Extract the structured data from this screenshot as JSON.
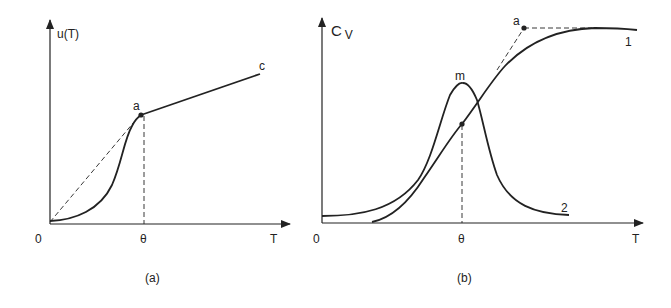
{
  "panel_a": {
    "caption": "(a)",
    "y_label": "u(T)",
    "x_label": "T",
    "origin_label": "0",
    "theta_label": "θ",
    "point_a_label": "a",
    "point_c_label": "c"
  },
  "panel_b": {
    "caption": "(b)",
    "y_label_main": "C",
    "y_label_sub": "V",
    "x_label": "T",
    "origin_label": "0",
    "theta_label": "θ",
    "point_a_label": "a",
    "peak_label": "m",
    "curve_1_label": "1",
    "curve_2_label": "2"
  },
  "colors": {
    "ink": "#222222",
    "background": "#ffffff"
  }
}
